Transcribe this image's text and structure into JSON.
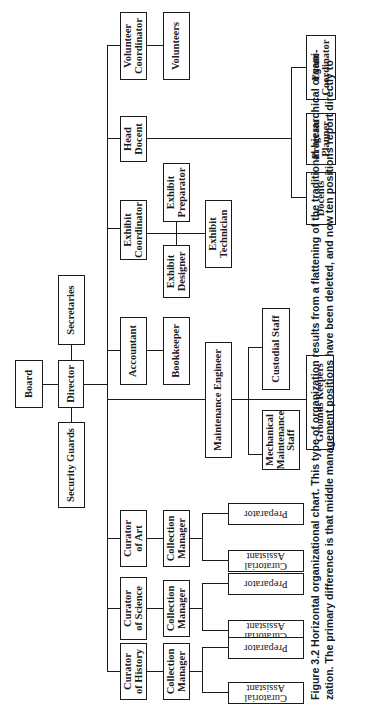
{
  "figure": {
    "number": "Figure 3.2",
    "title": "Horizontal organizational chart.",
    "caption_line1": "This type of organization results from a flattening of the traditional hierarchical organi-",
    "caption_line2": "zation. The primary difference is that middle management positions have been deleted, and now ten positions report directly to"
  },
  "org_chart": {
    "board": "Board",
    "director": "Director",
    "secretaries": "Secretaries",
    "security_guards": "Security Guards",
    "volunteer_coordinator": [
      "Volunteer",
      "Coordinator"
    ],
    "volunteers": "Volunteers",
    "head_docent": [
      "Head",
      "Docent"
    ],
    "docents": "Docents",
    "program_planner": [
      "Program",
      "Planner"
    ],
    "event_coordinator": [
      "Event",
      "Coordinator"
    ],
    "exhibit_coordinator": [
      "Exhibit",
      "Coordinator"
    ],
    "exhibit_preparator": [
      "Exhibit",
      "Preparator"
    ],
    "exhibit_designer": [
      "Exhibit",
      "Designer"
    ],
    "exhibit_technician": [
      "Exhibit",
      "Technician"
    ],
    "accountant": "Accountant",
    "bookkeeper": "Bookkeeper",
    "maintenance_engineer": "Maintenance Engineer",
    "custodial_staff": "Custodial Staff",
    "mechanical_maintenance_staff": [
      "Mechanical",
      "Maintenance",
      "Staff"
    ],
    "grounds_keepers": "Grounds Keepers",
    "curators": [
      {
        "title": [
          "Curator",
          "of Art"
        ],
        "collection_manager": [
          "Collection",
          "Manager"
        ],
        "preparator": "Preparator",
        "curatorial_assistant": "Curatorial Assistant"
      },
      {
        "title": [
          "Curator",
          "of Science"
        ],
        "collection_manager": [
          "Collection",
          "Manager"
        ],
        "preparator": "Preparator",
        "curatorial_assistant": "Curatorial Assistant"
      },
      {
        "title": [
          "Curator",
          "of History"
        ],
        "collection_manager": [
          "Collection",
          "Manager"
        ],
        "preparator": "Preparator",
        "curatorial_assistant": "Curatorial Assistant"
      }
    ]
  }
}
